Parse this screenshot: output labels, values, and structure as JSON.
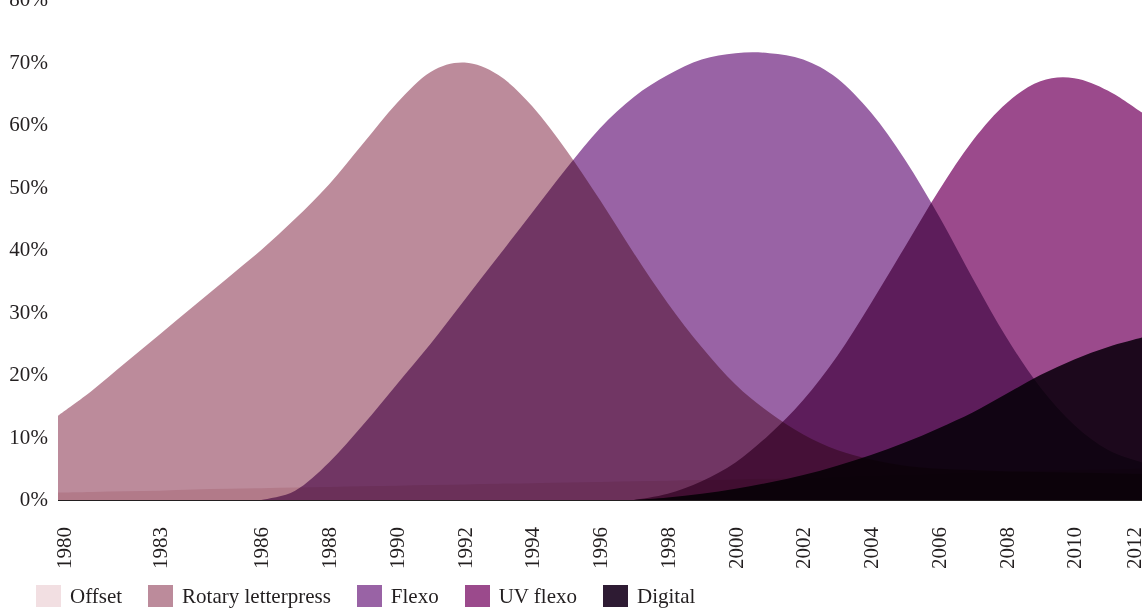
{
  "chart_data": {
    "type": "area",
    "title": "",
    "subtitle": "",
    "xlabel": "",
    "ylabel": "",
    "overlap_mode": "overlapping",
    "grid": false,
    "legend_position": "bottom-left",
    "xlim": [
      1980,
      2012
    ],
    "ylim": [
      0,
      80
    ],
    "y_tick_labels": [
      "80%",
      "70%",
      "60%",
      "50%",
      "40%",
      "30%",
      "20%",
      "10%",
      "0%"
    ],
    "y_tick_values": [
      80,
      70,
      60,
      50,
      40,
      30,
      20,
      10,
      0
    ],
    "x_tick_labels": [
      "1980",
      "1983",
      "1986",
      "1988",
      "1990",
      "1992",
      "1994",
      "1996",
      "1998",
      "2000",
      "2002",
      "2004",
      "2006",
      "2008",
      "2010",
      "2012"
    ],
    "x_tick_values": [
      1980,
      1983,
      1986,
      1988,
      1990,
      1992,
      1994,
      1996,
      1998,
      2000,
      2002,
      2004,
      2006,
      2008,
      2010,
      2012
    ],
    "x": [
      1980,
      1981,
      1982,
      1983,
      1984,
      1985,
      1986,
      1987,
      1988,
      1989,
      1990,
      1991,
      1992,
      1993,
      1994,
      1995,
      1996,
      1997,
      1998,
      1999,
      2000,
      2001,
      2002,
      2003,
      2004,
      2005,
      2006,
      2007,
      2008,
      2009,
      2010,
      2011,
      2012
    ],
    "series": [
      {
        "name": "Offset",
        "color": "#f2dfe2",
        "values": [
          1.2,
          1.3,
          1.4,
          1.5,
          1.7,
          1.8,
          1.9,
          2.0,
          2.1,
          2.2,
          2.3,
          2.4,
          2.5,
          2.6,
          2.7,
          2.8,
          2.9,
          3.0,
          3.1,
          3.2,
          3.3,
          3.4,
          3.5,
          3.7,
          3.9,
          4.0,
          4.2,
          4.4,
          4.5,
          4.7,
          4.8,
          4.9,
          5.0
        ]
      },
      {
        "name": "Rotary letterpress",
        "color": "#bc8b9b",
        "values": [
          13.5,
          17.5,
          22.0,
          26.5,
          31.0,
          35.5,
          40.0,
          45.0,
          50.5,
          57.0,
          63.5,
          68.5,
          70.0,
          68.0,
          63.0,
          56.0,
          48.0,
          39.5,
          31.5,
          24.5,
          18.5,
          14.0,
          10.5,
          8.0,
          6.5,
          5.5,
          5.0,
          4.8,
          4.6,
          4.5,
          4.4,
          4.3,
          4.2
        ]
      },
      {
        "name": "Flexo",
        "color": "#9963a5",
        "values": [
          0,
          0,
          0,
          0,
          0,
          0,
          0,
          1.5,
          6.0,
          12.0,
          18.5,
          25.0,
          32.0,
          39.0,
          46.0,
          53.0,
          59.5,
          64.5,
          68.0,
          70.5,
          71.5,
          71.5,
          70.5,
          67.5,
          62.0,
          54.5,
          45.5,
          35.5,
          26.0,
          18.0,
          12.0,
          8.0,
          6.0
        ]
      },
      {
        "name": "UV flexo",
        "color": "#9b4a8c",
        "values": [
          0,
          0,
          0,
          0,
          0,
          0,
          0,
          0,
          0,
          0,
          0,
          0,
          0,
          0,
          0,
          0,
          0,
          0,
          1.0,
          3.0,
          6.0,
          10.5,
          16.0,
          23.0,
          31.5,
          40.5,
          49.5,
          57.5,
          63.5,
          67.0,
          67.5,
          65.5,
          62.0
        ]
      },
      {
        "name": "Digital",
        "color": "#2e1b33",
        "values": [
          0,
          0,
          0,
          0,
          0,
          0,
          0,
          0,
          0,
          0,
          0,
          0,
          0,
          0,
          0,
          0,
          0,
          0,
          0.4,
          1.0,
          1.8,
          2.8,
          4.0,
          5.5,
          7.2,
          9.2,
          11.5,
          14.0,
          17.0,
          20.0,
          22.5,
          24.5,
          26.0
        ]
      }
    ]
  },
  "legend": {
    "items": [
      {
        "label": "Offset",
        "color": "#f2dfe2"
      },
      {
        "label": "Rotary letterpress",
        "color": "#bc8b9b"
      },
      {
        "label": "Flexo",
        "color": "#9963a5"
      },
      {
        "label": "UV flexo",
        "color": "#9b4a8c"
      },
      {
        "label": "Digital",
        "color": "#2e1b33"
      }
    ]
  }
}
